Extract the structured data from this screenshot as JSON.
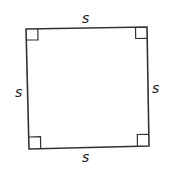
{
  "diagram": {
    "shape": "square",
    "labels": {
      "top": "s",
      "right": "s",
      "bottom": "s",
      "left": "s"
    },
    "right_angle_markers": 4,
    "stroke_color": "#333333",
    "background": "#ffffff"
  }
}
